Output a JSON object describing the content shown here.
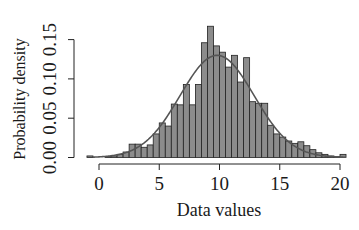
{
  "chart_data": {
    "type": "bar",
    "subtype": "histogram_with_density_curve",
    "title": "",
    "xlabel": "Data values",
    "ylabel": "Probability density",
    "xlim": [
      -1,
      20
    ],
    "ylim": [
      0,
      0.15
    ],
    "x_ticks": [
      0,
      5,
      10,
      15,
      20
    ],
    "x_tick_labels": [
      "0",
      "5",
      "10",
      "15",
      "20"
    ],
    "y_ticks": [
      0,
      0.05,
      0.1,
      0.15
    ],
    "y_tick_labels": [
      "0.00",
      "0.05",
      "0.10",
      "0.15"
    ],
    "grid": false,
    "legend": null,
    "bin_width": 0.5,
    "bins": [
      {
        "start": -1.0,
        "end": -0.5,
        "density": 0.002
      },
      {
        "start": -0.5,
        "end": 0.0,
        "density": 0.0
      },
      {
        "start": 0.0,
        "end": 0.5,
        "density": 0.0
      },
      {
        "start": 0.5,
        "end": 1.0,
        "density": 0.001
      },
      {
        "start": 1.0,
        "end": 1.5,
        "density": 0.002
      },
      {
        "start": 1.5,
        "end": 2.0,
        "density": 0.004
      },
      {
        "start": 2.0,
        "end": 2.5,
        "density": 0.007
      },
      {
        "start": 2.5,
        "end": 3.0,
        "density": 0.017
      },
      {
        "start": 3.0,
        "end": 3.5,
        "density": 0.017
      },
      {
        "start": 3.5,
        "end": 4.0,
        "density": 0.013
      },
      {
        "start": 4.0,
        "end": 4.5,
        "density": 0.016
      },
      {
        "start": 4.5,
        "end": 5.0,
        "density": 0.03
      },
      {
        "start": 5.0,
        "end": 5.5,
        "density": 0.044
      },
      {
        "start": 5.5,
        "end": 6.0,
        "density": 0.04
      },
      {
        "start": 6.0,
        "end": 6.5,
        "density": 0.068
      },
      {
        "start": 6.5,
        "end": 7.0,
        "density": 0.067
      },
      {
        "start": 7.0,
        "end": 7.5,
        "density": 0.093
      },
      {
        "start": 7.5,
        "end": 8.0,
        "density": 0.067
      },
      {
        "start": 8.0,
        "end": 8.5,
        "density": 0.093
      },
      {
        "start": 8.5,
        "end": 9.0,
        "density": 0.146
      },
      {
        "start": 9.0,
        "end": 9.5,
        "density": 0.167
      },
      {
        "start": 9.5,
        "end": 10.0,
        "density": 0.142
      },
      {
        "start": 10.0,
        "end": 10.5,
        "density": 0.134
      },
      {
        "start": 10.5,
        "end": 11.0,
        "density": 0.115
      },
      {
        "start": 11.0,
        "end": 11.5,
        "density": 0.13
      },
      {
        "start": 11.5,
        "end": 12.0,
        "density": 0.096
      },
      {
        "start": 12.0,
        "end": 12.5,
        "density": 0.127
      },
      {
        "start": 12.5,
        "end": 13.0,
        "density": 0.071
      },
      {
        "start": 13.0,
        "end": 13.5,
        "density": 0.069
      },
      {
        "start": 13.5,
        "end": 14.0,
        "density": 0.069
      },
      {
        "start": 14.0,
        "end": 14.5,
        "density": 0.041
      },
      {
        "start": 14.5,
        "end": 15.0,
        "density": 0.03
      },
      {
        "start": 15.0,
        "end": 15.5,
        "density": 0.026
      },
      {
        "start": 15.5,
        "end": 16.0,
        "density": 0.021
      },
      {
        "start": 16.0,
        "end": 16.5,
        "density": 0.018
      },
      {
        "start": 16.5,
        "end": 17.0,
        "density": 0.02
      },
      {
        "start": 17.0,
        "end": 17.5,
        "density": 0.015
      },
      {
        "start": 17.5,
        "end": 18.0,
        "density": 0.01
      },
      {
        "start": 18.0,
        "end": 18.5,
        "density": 0.006
      },
      {
        "start": 18.5,
        "end": 19.0,
        "density": 0.004
      },
      {
        "start": 19.0,
        "end": 19.5,
        "density": 0.002
      },
      {
        "start": 19.5,
        "end": 20.0,
        "density": 0.001
      },
      {
        "start": 20.0,
        "end": 20.5,
        "density": 0.004
      }
    ],
    "density_curve": {
      "type": "normal",
      "mean": 9.8,
      "sd": 3.07,
      "peak_density": 0.13,
      "x_range": [
        -0.5,
        20.5
      ]
    }
  },
  "style": {
    "bar_fill": "#8c8c8c",
    "bar_stroke": "#222222",
    "curve_color": "#555555",
    "axis_color": "#222222",
    "text_color": "#1a1a1a"
  }
}
